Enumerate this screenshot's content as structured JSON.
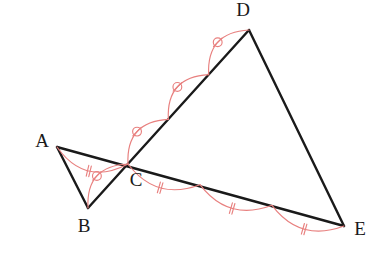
{
  "figure": {
    "width": 384,
    "height": 260,
    "background_color": "#ffffff",
    "line_color": "#1a1a1a",
    "mark_color": "#e8807f"
  },
  "points": {
    "A": {
      "label": "A",
      "x": 57,
      "y": 147,
      "label_x": 42,
      "label_y": 143
    },
    "B": {
      "label": "B",
      "x": 88,
      "y": 208,
      "label_x": 84,
      "label_y": 228
    },
    "C": {
      "label": "C",
      "x": 128,
      "y": 164,
      "label_x": 136,
      "label_y": 182
    },
    "D": {
      "label": "D",
      "x": 249,
      "y": 30,
      "label_x": 243,
      "label_y": 12
    },
    "E": {
      "label": "E",
      "x": 344,
      "y": 226,
      "label_x": 360,
      "label_y": 231
    }
  },
  "segments": [
    {
      "name": "segment-AB",
      "from": "A",
      "to": "B"
    },
    {
      "name": "segment-AE",
      "from": "A",
      "to": "E"
    },
    {
      "name": "segment-BD",
      "from": "B",
      "to": "D"
    },
    {
      "name": "segment-DE",
      "from": "D",
      "to": "E"
    }
  ],
  "congruence_marks": {
    "double_tick_arcs": [
      {
        "name": "arc-AC",
        "from": "A",
        "to": "C",
        "bulge": 16,
        "ticks": 2
      },
      {
        "name": "arc-CE-1",
        "from": "C",
        "to": "E",
        "t0": 0.0,
        "t1": 0.3333,
        "bulge": 14,
        "ticks": 2
      },
      {
        "name": "arc-CE-2",
        "from": "C",
        "to": "E",
        "t0": 0.3333,
        "t1": 0.6667,
        "bulge": 14,
        "ticks": 2
      },
      {
        "name": "arc-CE-3",
        "from": "C",
        "to": "E",
        "t0": 0.6667,
        "t1": 1.0,
        "bulge": 14,
        "ticks": 2
      }
    ],
    "slash_circle_arcs": [
      {
        "name": "arc-BC",
        "from": "B",
        "to": "C",
        "bulge": -15
      },
      {
        "name": "arc-CD-1",
        "from": "C",
        "to": "D",
        "t0": 0.0,
        "t1": 0.3333,
        "bulge": -15
      },
      {
        "name": "arc-CD-2",
        "from": "C",
        "to": "D",
        "t0": 0.3333,
        "t1": 0.6667,
        "bulge": -15
      },
      {
        "name": "arc-CD-3",
        "from": "C",
        "to": "D",
        "t0": 0.6667,
        "t1": 1.0,
        "bulge": -15
      }
    ]
  },
  "relations": {
    "ratio_AC_to_CE": "1:3",
    "ratio_BC_to_CD": "1:3"
  }
}
